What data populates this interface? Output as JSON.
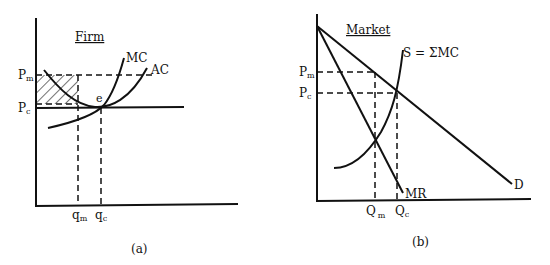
{
  "panels": [
    {
      "id": "a",
      "title": "Firm",
      "caption": "(a)",
      "y_labels": {
        "pm": "P",
        "pm_sub": "m",
        "pc": "P",
        "pc_sub": "c"
      },
      "x_labels": {
        "qm": "q",
        "qm_sub": "m",
        "qc": "q",
        "qc_sub": "c"
      },
      "curves": {
        "mc": "MC",
        "ac": "AC"
      },
      "point": "e"
    },
    {
      "id": "b",
      "title": "Market",
      "caption": "(b)",
      "y_labels": {
        "pm": "P",
        "pm_sub": "m",
        "pc": "P",
        "pc_sub": "c"
      },
      "x_labels": {
        "qm": "Q",
        "qm_sub": "m",
        "qc": "Q",
        "qc_sub": "c"
      },
      "curves": {
        "supply": "S = ΣMC",
        "mr": "MR",
        "demand": "D"
      }
    }
  ]
}
